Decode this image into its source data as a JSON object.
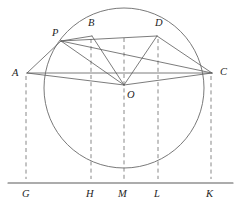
{
  "figure": {
    "type": "geometry-diagram",
    "width": 242,
    "height": 204,
    "background_color": "#ffffff",
    "stroke_color": "#5a5a5a",
    "dashed_color": "#7a7a7a",
    "label_color": "#1d1d1d"
  },
  "circle": {
    "name": "main-circle",
    "center_label": "O",
    "cx": 124,
    "cy": 88,
    "r": 80
  },
  "points": [
    {
      "id": "P",
      "label": "P",
      "x": 61,
      "y": 41,
      "label_x": 52,
      "label_y": 36
    },
    {
      "id": "B",
      "label": "B",
      "x": 92,
      "y": 36,
      "label_x": 88,
      "label_y": 26
    },
    {
      "id": "D",
      "label": "D",
      "x": 157,
      "y": 36,
      "label_x": 155,
      "label_y": 26
    },
    {
      "id": "A",
      "label": "A",
      "x": 27,
      "y": 73,
      "label_x": 12,
      "label_y": 76
    },
    {
      "id": "C",
      "label": "C",
      "x": 212,
      "y": 73,
      "label_x": 220,
      "label_y": 75
    },
    {
      "id": "O",
      "label": "O",
      "x": 124,
      "y": 85,
      "label_x": 127,
      "label_y": 98
    },
    {
      "id": "G",
      "label": "G",
      "x": 26,
      "y": 183,
      "label_x": 22,
      "label_y": 197
    },
    {
      "id": "H",
      "label": "H",
      "x": 91,
      "y": 183,
      "label_x": 86,
      "label_y": 197
    },
    {
      "id": "M",
      "label": "M",
      "x": 124,
      "y": 183,
      "label_x": 118,
      "label_y": 197
    },
    {
      "id": "L",
      "label": "L",
      "x": 158,
      "y": 183,
      "label_x": 154,
      "label_y": 197
    },
    {
      "id": "K",
      "label": "K",
      "x": 211,
      "y": 183,
      "label_x": 206,
      "label_y": 197
    }
  ],
  "segments": [
    {
      "name": "segment-A-P",
      "from": "A",
      "to": "P",
      "x1": 27,
      "y1": 73,
      "x2": 61,
      "y2": 41
    },
    {
      "name": "segment-A-C",
      "from": "A",
      "to": "C",
      "x1": 27,
      "y1": 73,
      "x2": 212,
      "y2": 73
    },
    {
      "name": "segment-A-O",
      "from": "A",
      "to": "O",
      "x1": 27,
      "y1": 73,
      "x2": 124,
      "y2": 85
    },
    {
      "name": "segment-O-C",
      "from": "O",
      "to": "C",
      "x1": 124,
      "y1": 85,
      "x2": 212,
      "y2": 73
    },
    {
      "name": "segment-P-B",
      "from": "P",
      "to": "B",
      "x1": 61,
      "y1": 41,
      "x2": 92,
      "y2": 36
    },
    {
      "name": "segment-P-D",
      "from": "P",
      "to": "D",
      "x1": 61,
      "y1": 41,
      "x2": 157,
      "y2": 36
    },
    {
      "name": "segment-P-O",
      "from": "P",
      "to": "O",
      "x1": 61,
      "y1": 41,
      "x2": 124,
      "y2": 85
    },
    {
      "name": "segment-P-C",
      "from": "P",
      "to": "C",
      "x1": 61,
      "y1": 41,
      "x2": 212,
      "y2": 73
    },
    {
      "name": "segment-B-O",
      "from": "B",
      "to": "O",
      "x1": 92,
      "y1": 36,
      "x2": 124,
      "y2": 85
    },
    {
      "name": "segment-D-O",
      "from": "D",
      "to": "O",
      "x1": 157,
      "y1": 36,
      "x2": 124,
      "y2": 85
    },
    {
      "name": "segment-D-C",
      "from": "D",
      "to": "C",
      "x1": 157,
      "y1": 36,
      "x2": 212,
      "y2": 73
    }
  ],
  "dashed_verticals": [
    {
      "name": "dashed-A-G",
      "from": "A",
      "to": "G",
      "x": 26,
      "y1": 76,
      "y2": 179
    },
    {
      "name": "dashed-B-H",
      "from": "B",
      "to": "H",
      "x": 91,
      "y1": 39,
      "y2": 179
    },
    {
      "name": "dashed-O-M",
      "from": "O",
      "to": "M",
      "x": 124,
      "y1": 38,
      "y2": 179
    },
    {
      "name": "dashed-D-L",
      "from": "D",
      "to": "L",
      "x": 158,
      "y1": 39,
      "y2": 179
    },
    {
      "name": "dashed-C-K",
      "from": "C",
      "to": "K",
      "x": 211,
      "y1": 76,
      "y2": 179
    }
  ],
  "baseline": {
    "name": "baseline-GK",
    "x1": 8,
    "y1": 183,
    "x2": 233,
    "y2": 183,
    "tick_labels": [
      "G",
      "H",
      "M",
      "L",
      "K"
    ]
  }
}
